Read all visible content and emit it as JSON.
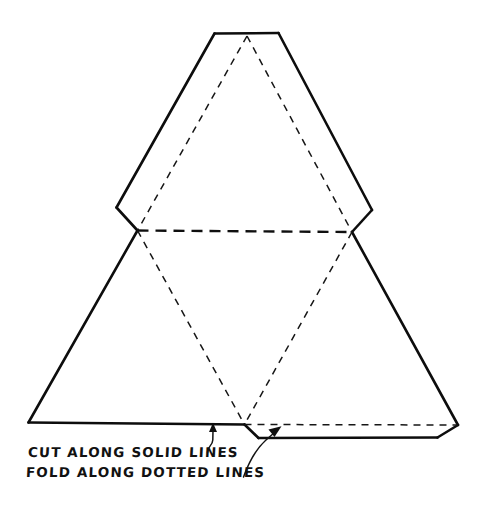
{
  "figure": {
    "background_color": "#ffffff",
    "ink_color": "#111111",
    "width": 486,
    "height": 517
  },
  "annotations": {
    "cut_label": "CUT ALONG SOLID LINES",
    "fold_label": "FOLD ALONG DOTTED LINES"
  },
  "legend": {
    "solid_meaning": "cut",
    "dotted_meaning": "fold"
  },
  "geometry": {
    "description": "Large outer triangle with truncated apex, hexagonal mid-band notches, inner dashed triangle and fold lines, plus a glue tab along the bottom right edge.",
    "outer_outline": [
      [
        215,
        33
      ],
      [
        278,
        33
      ],
      [
        352,
        232
      ],
      [
        372,
        210
      ],
      [
        458,
        425
      ],
      [
        245,
        425
      ],
      [
        28,
        423
      ],
      [
        137,
        230
      ],
      [
        117,
        208
      ]
    ],
    "tab_outline": [
      [
        244,
        424
      ],
      [
        258,
        438
      ],
      [
        437,
        438
      ],
      [
        458,
        425
      ]
    ],
    "fold_lines": [
      {
        "name": "mid-horizontal-fold",
        "from": [
          137,
          230
        ],
        "to": [
          352,
          232
        ],
        "weight": "bold"
      },
      {
        "name": "left-diagonal-fold",
        "from": [
          247,
          36
        ],
        "to": [
          137,
          230
        ],
        "weight": "normal"
      },
      {
        "name": "right-diagonal-fold",
        "from": [
          247,
          36
        ],
        "to": [
          352,
          232
        ],
        "weight": "normal"
      },
      {
        "name": "lower-left-diagonal-fold",
        "from": [
          137,
          230
        ],
        "to": [
          244,
          424
        ],
        "weight": "normal"
      },
      {
        "name": "lower-right-diagonal-fold",
        "from": [
          352,
          232
        ],
        "to": [
          244,
          424
        ],
        "weight": "normal"
      },
      {
        "name": "tab-fold",
        "from": [
          244,
          424
        ],
        "to": [
          458,
          425
        ],
        "weight": "normal"
      }
    ],
    "leaders": [
      {
        "name": "cut-leader",
        "target": [
          213,
          424
        ],
        "points_at": "solid bottom edge"
      },
      {
        "name": "fold-leader",
        "target": [
          281,
          427
        ],
        "points_at": "dashed tab fold line"
      }
    ]
  }
}
